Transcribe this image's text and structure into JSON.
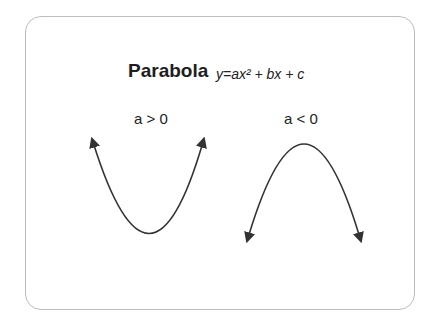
{
  "title": "Parabola",
  "formula": "y=ax² + bx + c",
  "cases": [
    {
      "label": "a > 0",
      "shape": "opens-up"
    },
    {
      "label": "a < 0",
      "shape": "opens-down"
    }
  ],
  "colors": {
    "stroke": "#333333",
    "frame": "#bdbdbd",
    "background": "#ffffff"
  }
}
